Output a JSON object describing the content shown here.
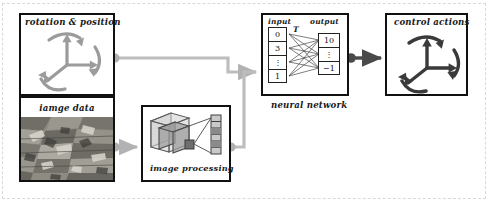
{
  "diagram": {
    "colors": {
      "box_border": "#111111",
      "wire_light": "#b9b9b9",
      "wire_dark": "#4a4a4a",
      "arrow_gray": "#a8a8a8",
      "text": "#1a1a1a"
    }
  },
  "rotation_position": {
    "label": "rotation & position",
    "icon": "3d-axes-with-rotation-arrows"
  },
  "image_data": {
    "label": "iamge data",
    "icon": "rubble-photograph"
  },
  "image_processing": {
    "label": "image processing",
    "icon": "convolution-cube-stack"
  },
  "neural_network": {
    "label": "neural network",
    "input_header": "input",
    "output_header": "output",
    "transform_label": "T",
    "input_cells": [
      "0",
      "3",
      "⋮",
      "1"
    ],
    "output_cells": [
      "10",
      "⋮",
      "−1"
    ]
  },
  "control_actions": {
    "label": "control actions",
    "icon": "3d-axes-with-rotation-arrows"
  },
  "connectors": [
    {
      "name": "rotation-to-network",
      "from": "rotation_position",
      "to": "neural_network"
    },
    {
      "name": "image-data-to-processing",
      "from": "image_data",
      "to": "image_processing"
    },
    {
      "name": "processing-to-network",
      "from": "image_processing",
      "to": "neural_network"
    },
    {
      "name": "network-to-control",
      "from": "neural_network",
      "to": "control_actions"
    }
  ]
}
